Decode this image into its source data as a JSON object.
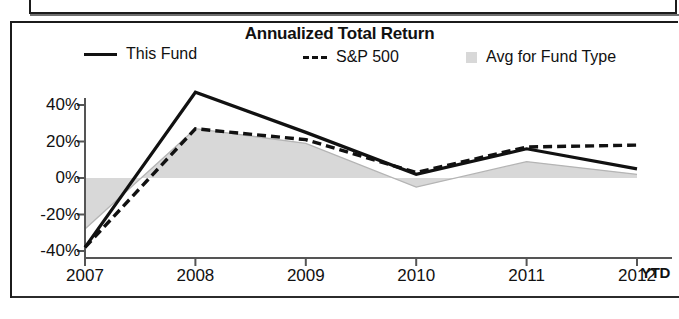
{
  "chart_data": {
    "type": "line",
    "title": "Annualized Total Return",
    "xlabel": "",
    "ylabel": "",
    "x": [
      "2007",
      "2008",
      "2009",
      "2010",
      "2011",
      "2012"
    ],
    "x_note": "YTD",
    "categories": [
      "2007",
      "2008",
      "2009",
      "2010",
      "2011",
      "2012"
    ],
    "ylim": [
      -40,
      50
    ],
    "ytick_values": [
      40,
      20,
      0,
      -20,
      -40
    ],
    "ytick_labels": [
      "40%",
      "20%",
      "0%",
      "-20%",
      "-40%"
    ],
    "grid": false,
    "legend_position": "top",
    "series": [
      {
        "name": "This Fund",
        "style": "solid",
        "color": "#111111",
        "values": [
          -38,
          47,
          25,
          2,
          16,
          5
        ]
      },
      {
        "name": "S&P 500",
        "style": "dashed",
        "color": "#111111",
        "values": [
          -38,
          27,
          21,
          3,
          17,
          18
        ]
      },
      {
        "name": "Avg for Fund Type",
        "style": "area",
        "color": "#d8d8d8",
        "values": [
          -28,
          27,
          19,
          -5,
          9,
          2
        ]
      }
    ]
  },
  "chart": {
    "title": "Annualized Total Return",
    "ytd_suffix": "YTD",
    "legend": [
      {
        "label": "This Fund",
        "marker": "solid-line-swatch"
      },
      {
        "label": "S&P 500",
        "marker": "dashed-line-swatch"
      },
      {
        "label": "Avg for Fund Type",
        "marker": "area-swatch"
      }
    ],
    "y_ticks": [
      "40%",
      "20%",
      "0%",
      "-20%",
      "-40%"
    ],
    "x_ticks": [
      "2007",
      "2008",
      "2009",
      "2010",
      "2011",
      "2012"
    ]
  },
  "colors": {
    "line": "#111111",
    "area_fill": "#d8d8d8",
    "axis": "#555555",
    "frame": "#1b1b1b"
  }
}
